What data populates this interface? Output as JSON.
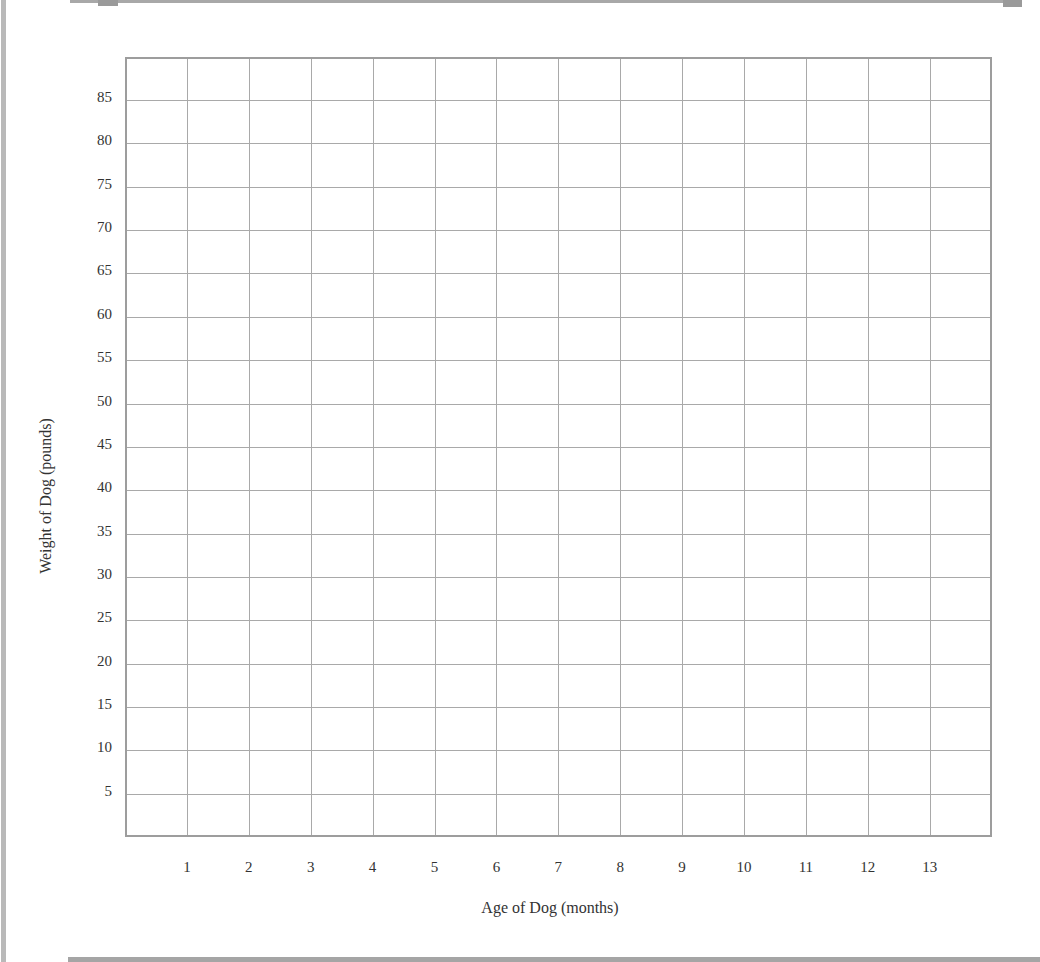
{
  "chart_data": {
    "type": "line",
    "title": "",
    "xlabel": "Age of Dog (months)",
    "ylabel": "Weight of Dog (pounds)",
    "x_ticks": [
      "1",
      "2",
      "3",
      "4",
      "5",
      "6",
      "7",
      "8",
      "9",
      "10",
      "11",
      "12",
      "13"
    ],
    "y_ticks": [
      "85",
      "80",
      "75",
      "70",
      "65",
      "60",
      "55",
      "50",
      "45",
      "40",
      "35",
      "30",
      "25",
      "20",
      "15",
      "10",
      "5"
    ],
    "xlim": [
      0,
      14
    ],
    "ylim": [
      0,
      90
    ],
    "grid": true,
    "series": [],
    "note": "Blank graph grid with no plotted data"
  },
  "colors": {
    "grid": "#a9a9a9",
    "border": "#9d9d9d",
    "text": "#333333"
  }
}
